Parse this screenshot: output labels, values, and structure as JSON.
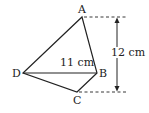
{
  "diagram": {
    "type": "quadrilateral",
    "vertices": {
      "A": "A",
      "B": "B",
      "C": "C",
      "D": "D"
    },
    "diagonal_label": "11 cm",
    "height_label": "12 cm",
    "colors": {
      "stroke": "#222222",
      "background": "#ffffff"
    }
  }
}
